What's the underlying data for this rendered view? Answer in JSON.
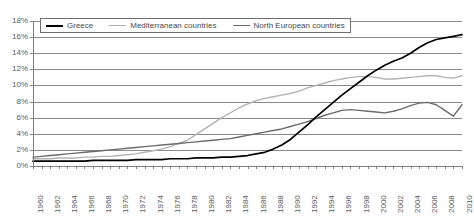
{
  "chart_data": {
    "type": "line",
    "title": "",
    "xlabel": "",
    "ylabel": "",
    "xlim": [
      1960,
      2010
    ],
    "ylim": [
      0,
      18
    ],
    "grid": true,
    "legend_position": "top-left-inside",
    "ytick_labels": [
      "18%",
      "16%",
      "14%",
      "12%",
      "10%",
      "8%",
      "6%",
      "4%",
      "2%",
      "0%"
    ],
    "ytick_values": [
      18,
      16,
      14,
      12,
      10,
      8,
      6,
      4,
      2,
      0
    ],
    "xtick_labels": [
      "1960",
      "1962",
      "1964",
      "1966",
      "1968",
      "1970",
      "1972",
      "1974",
      "1976",
      "1978",
      "1980",
      "1982",
      "1984",
      "1986",
      "1988",
      "1990",
      "1992",
      "1994",
      "1996",
      "1998",
      "2000",
      "2002",
      "2004",
      "2006",
      "2008",
      "2010"
    ],
    "x": [
      1960,
      1961,
      1962,
      1963,
      1964,
      1965,
      1966,
      1967,
      1968,
      1969,
      1970,
      1971,
      1972,
      1973,
      1974,
      1975,
      1976,
      1977,
      1978,
      1979,
      1980,
      1981,
      1982,
      1983,
      1984,
      1985,
      1986,
      1987,
      1988,
      1989,
      1990,
      1991,
      1992,
      1993,
      1994,
      1995,
      1996,
      1997,
      1998,
      1999,
      2000,
      2001,
      2002,
      2003,
      2004,
      2005,
      2006,
      2007,
      2008,
      2009,
      2010
    ],
    "series": [
      {
        "name": "Greece",
        "color": "#000000",
        "width": 1.7,
        "values": [
          0.6,
          0.6,
          0.6,
          0.6,
          0.6,
          0.6,
          0.6,
          0.7,
          0.7,
          0.7,
          0.7,
          0.7,
          0.8,
          0.8,
          0.8,
          0.8,
          0.9,
          0.9,
          0.9,
          1.0,
          1.0,
          1.0,
          1.1,
          1.1,
          1.2,
          1.3,
          1.5,
          1.7,
          2.1,
          2.6,
          3.3,
          4.2,
          5.1,
          6.1,
          7.0,
          7.9,
          8.8,
          9.6,
          10.4,
          11.2,
          11.9,
          12.5,
          13.0,
          13.4,
          14.0,
          14.7,
          15.3,
          15.7,
          15.9,
          16.1,
          16.3
        ]
      },
      {
        "name": "Mediterranean countries",
        "color": "#b4b4b4",
        "width": 1.4,
        "values": [
          0.9,
          0.9,
          0.9,
          1.0,
          1.0,
          1.0,
          1.1,
          1.1,
          1.2,
          1.2,
          1.3,
          1.4,
          1.5,
          1.7,
          1.9,
          2.1,
          2.4,
          2.8,
          3.2,
          3.9,
          4.6,
          5.3,
          6.0,
          6.6,
          7.2,
          7.7,
          8.1,
          8.4,
          8.6,
          8.8,
          9.0,
          9.3,
          9.7,
          10.0,
          10.3,
          10.6,
          10.8,
          11.0,
          11.1,
          11.1,
          11.0,
          10.8,
          10.8,
          10.9,
          11.0,
          11.1,
          11.2,
          11.2,
          11.0,
          10.9,
          11.2
        ]
      },
      {
        "name": "North European countries",
        "color": "#6b6b6b",
        "width": 1.4,
        "values": [
          1.1,
          1.2,
          1.3,
          1.4,
          1.5,
          1.6,
          1.7,
          1.8,
          1.9,
          2.0,
          2.1,
          2.2,
          2.3,
          2.4,
          2.5,
          2.6,
          2.7,
          2.8,
          2.9,
          3.0,
          3.1,
          3.2,
          3.3,
          3.4,
          3.6,
          3.8,
          4.0,
          4.2,
          4.4,
          4.6,
          4.9,
          5.2,
          5.5,
          5.9,
          6.3,
          6.6,
          6.9,
          7.0,
          6.9,
          6.8,
          6.7,
          6.6,
          6.8,
          7.1,
          7.5,
          7.8,
          7.9,
          7.6,
          6.9,
          6.2,
          7.6
        ]
      }
    ]
  }
}
